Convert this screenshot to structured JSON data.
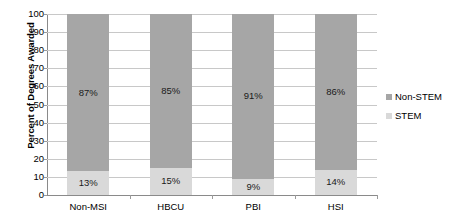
{
  "chart_data": {
    "type": "bar",
    "subtype": "stacked-100-percent",
    "title": "",
    "xlabel": "",
    "ylabel": "Percent of Degrees Awarded",
    "ylim": [
      0,
      100
    ],
    "ytick_step": 10,
    "yticks": [
      100,
      90,
      80,
      70,
      60,
      50,
      40,
      30,
      20,
      10,
      0
    ],
    "grid": true,
    "legend_position": "right",
    "categories": [
      "Non-MSI",
      "HBCU",
      "PBI",
      "HSI"
    ],
    "series": [
      {
        "name": "Non-STEM",
        "color": "#a6a6a6",
        "values": [
          87,
          85,
          91,
          86
        ],
        "labels": [
          "87%",
          "85%",
          "91%",
          "86%"
        ]
      },
      {
        "name": "STEM",
        "color": "#d9d9d9",
        "values": [
          13,
          15,
          9,
          14
        ],
        "labels": [
          "13%",
          "15%",
          "9%",
          "14%"
        ]
      }
    ]
  },
  "legend": {
    "items": [
      {
        "label": "Non-STEM",
        "color": "#a6a6a6"
      },
      {
        "label": "STEM",
        "color": "#d9d9d9"
      }
    ]
  },
  "colors": {
    "non_stem": "#a6a6a6",
    "stem": "#d9d9d9",
    "gridline": "#c8c8c8",
    "axis": "#8a8a8a",
    "text": "#1a1a1a",
    "background": "#ffffff"
  }
}
